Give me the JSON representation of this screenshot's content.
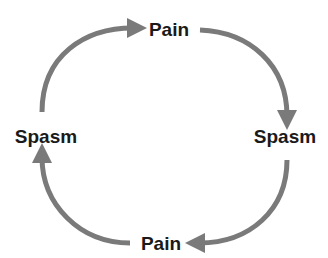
{
  "diagram": {
    "type": "cycle",
    "nodes": [
      {
        "id": "top",
        "label": "Pain"
      },
      {
        "id": "right",
        "label": "Spasm"
      },
      {
        "id": "bottom",
        "label": "Pain"
      },
      {
        "id": "left",
        "label": "Spasm"
      }
    ],
    "edges": [
      {
        "from": "left",
        "to": "top"
      },
      {
        "from": "top",
        "to": "right"
      },
      {
        "from": "right",
        "to": "bottom"
      },
      {
        "from": "bottom",
        "to": "left"
      }
    ],
    "arrow_color": "#7a7a7a",
    "text_color": "#1a1a1a"
  }
}
